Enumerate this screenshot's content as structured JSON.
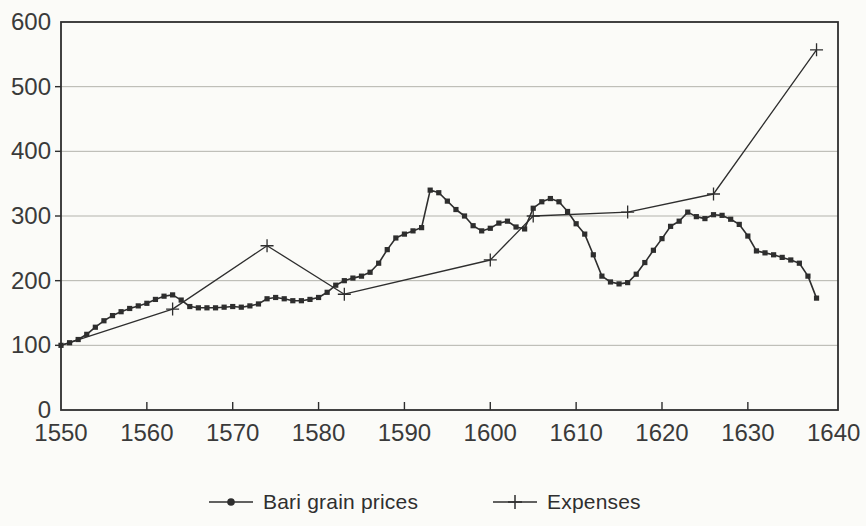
{
  "figure": {
    "background_color": "#fbfbf8",
    "line_color": "#2e2e2e",
    "grid_color": "#b3b3ac",
    "text_color": "#3a3a3a"
  },
  "chart_data": {
    "type": "line",
    "title": "",
    "xlabel": "",
    "ylabel": "",
    "xlim": [
      1550,
      1640.5
    ],
    "ylim": [
      0,
      600
    ],
    "x_ticks": [
      1550,
      1560,
      1570,
      1580,
      1590,
      1600,
      1610,
      1620,
      1630,
      1640
    ],
    "y_ticks": [
      0,
      100,
      200,
      300,
      400,
      500,
      600
    ],
    "grid": "horizontal",
    "legend_position": "bottom-center",
    "series": [
      {
        "name": "Bari grain prices",
        "marker": "square",
        "x": [
          1550,
          1551,
          1552,
          1553,
          1554,
          1555,
          1556,
          1557,
          1558,
          1559,
          1560,
          1561,
          1562,
          1563,
          1564,
          1565,
          1566,
          1567,
          1568,
          1569,
          1570,
          1571,
          1572,
          1573,
          1574,
          1575,
          1576,
          1577,
          1578,
          1579,
          1580,
          1581,
          1582,
          1583,
          1584,
          1585,
          1586,
          1587,
          1588,
          1589,
          1590,
          1591,
          1592,
          1593,
          1594,
          1595,
          1596,
          1597,
          1598,
          1599,
          1600,
          1601,
          1602,
          1603,
          1604,
          1605,
          1606,
          1607,
          1608,
          1609,
          1610,
          1611,
          1612,
          1613,
          1614,
          1615,
          1616,
          1617,
          1618,
          1619,
          1620,
          1621,
          1622,
          1623,
          1624,
          1625,
          1626,
          1627,
          1628,
          1629,
          1630,
          1631,
          1632,
          1633,
          1634,
          1635,
          1636,
          1637,
          1638
        ],
        "y": [
          100,
          104,
          109,
          117,
          128,
          138,
          146,
          152,
          157,
          161,
          165,
          171,
          176,
          178,
          170,
          160,
          158,
          158,
          158,
          159,
          160,
          159,
          161,
          164,
          172,
          174,
          172,
          169,
          169,
          171,
          174,
          182,
          193,
          200,
          204,
          207,
          213,
          227,
          248,
          266,
          272,
          277,
          282,
          340,
          336,
          323,
          310,
          300,
          285,
          277,
          281,
          289,
          292,
          283,
          280,
          312,
          322,
          327,
          322,
          307,
          288,
          272,
          240,
          207,
          198,
          195,
          197,
          210,
          228,
          247,
          265,
          284,
          292,
          306,
          299,
          296,
          302,
          301,
          295,
          287,
          269,
          246,
          243,
          240,
          236,
          232,
          227,
          207,
          173
        ]
      },
      {
        "name": "Expenses",
        "marker": "plus",
        "x": [
          1550,
          1563,
          1574,
          1583,
          1600,
          1605,
          1616,
          1626,
          1638
        ],
        "y": [
          100,
          156,
          254,
          179,
          232,
          300,
          306,
          334,
          557
        ]
      }
    ]
  }
}
